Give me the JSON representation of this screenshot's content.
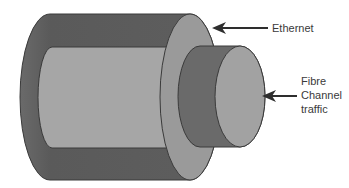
{
  "diagram": {
    "labels": {
      "ethernet": "Ethernet",
      "fibre_line1": "Fibre",
      "fibre_line2": "Channel",
      "fibre_line3": "traffic"
    },
    "colors": {
      "outer_dark": "#5e5e5e",
      "outer_face": "#9a9a9a",
      "inner_light": "#a6a6a6",
      "small_dark": "#6a6a6a",
      "small_face": "#a2a2a2",
      "outline": "#3a3a3a",
      "arrow": "#2e2e2e"
    }
  }
}
